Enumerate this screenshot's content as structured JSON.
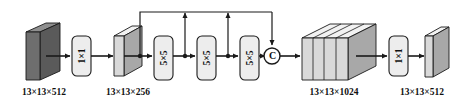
{
  "diagram": {
    "type": "neural-network-block-diagram",
    "colors": {
      "stroke": "#1a1a1a",
      "tensor_dark_front": "#6e6e6e",
      "tensor_dark_top": "#8f8f8f",
      "tensor_dark_side": "#5a5a5a",
      "tensor_light_front": "#d9d9d9",
      "tensor_light_top": "#f2f2f2",
      "tensor_light_side": "#a8a8a8",
      "op_box_fill": "#ededed",
      "background": "#ffffff"
    },
    "tensors": [
      {
        "id": "input",
        "label": "13×13×512",
        "shade": "dark"
      },
      {
        "id": "reduce",
        "label": "13×13×256",
        "shade": "light"
      },
      {
        "id": "concat",
        "label": "13×13×1024",
        "shade": "light",
        "slabs": 4
      },
      {
        "id": "output",
        "label": "13×13×512",
        "shade": "light"
      }
    ],
    "operations": [
      {
        "id": "conv-in",
        "label": "1×1",
        "kind": "conv"
      },
      {
        "id": "pool-1",
        "label": "5×5",
        "kind": "maxpool"
      },
      {
        "id": "pool-2",
        "label": "5×5",
        "kind": "maxpool"
      },
      {
        "id": "pool-3",
        "label": "5×5",
        "kind": "maxpool"
      },
      {
        "id": "conv-out",
        "label": "1×1",
        "kind": "conv"
      }
    ],
    "concat_node": {
      "id": "concat-node",
      "glyph": "C",
      "meaning": "concatenate"
    },
    "skip_connections": [
      {
        "from": "reduce-branch",
        "to": "concat-node"
      },
      {
        "from": "pool-1-branch",
        "to": "concat-node"
      },
      {
        "from": "pool-2-branch",
        "to": "concat-node"
      },
      {
        "from": "pool-3-output",
        "to": "concat-node"
      }
    ]
  }
}
